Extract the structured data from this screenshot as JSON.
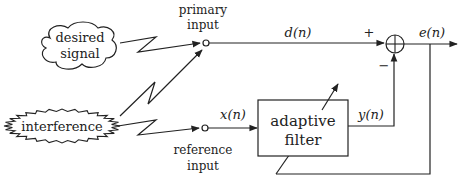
{
  "diagram": {
    "sources": {
      "desired": {
        "line1": "desired",
        "line2": "signal",
        "shape": "cloud"
      },
      "interference": {
        "label": "interference",
        "shape": "starburst-ellipse"
      }
    },
    "inputs": {
      "primary": {
        "line1": "primary",
        "line2": "input"
      },
      "reference": {
        "line1": "reference",
        "line2": "input"
      }
    },
    "signals": {
      "d": "d(n)",
      "x": "x(n)",
      "y": "y(n)",
      "e": "e(n)"
    },
    "summer": {
      "plus": "+",
      "minus": "−"
    },
    "filter": {
      "line1": "adaptive",
      "line2": "filter"
    },
    "colors": {
      "stroke": "#222222",
      "background": "#ffffff"
    }
  }
}
